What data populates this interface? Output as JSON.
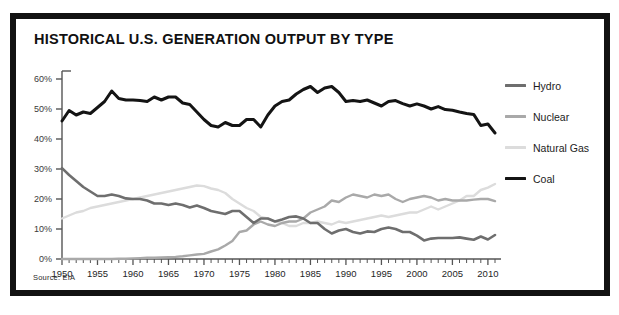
{
  "figure": {
    "title": "HISTORICAL U.S. GENERATION OUTPUT BY TYPE",
    "source": "Source: EIA"
  },
  "legend": {
    "position": "right",
    "items": [
      {
        "label": "Hydro",
        "color": "#6e6e6e"
      },
      {
        "label": "Nuclear",
        "color": "#a9a9a9"
      },
      {
        "label": "Natural Gas",
        "color": "#dcdcdc"
      },
      {
        "label": "Coal",
        "color": "#141414"
      }
    ]
  },
  "axes": {
    "y_ticks": [
      "0%",
      "10%",
      "20%",
      "30%",
      "40%",
      "50%",
      "60%"
    ],
    "x_ticks": [
      "1950",
      "1955",
      "1960",
      "1965",
      "1970",
      "1975",
      "1980",
      "1985",
      "1990",
      "1995",
      "2000",
      "2005",
      "2010"
    ]
  },
  "chart_data": {
    "type": "line",
    "title": "HISTORICAL U.S. GENERATION OUTPUT BY TYPE",
    "subtitle": "",
    "xlabel": "",
    "ylabel": "",
    "xlim": [
      1950,
      2011
    ],
    "ylim": [
      0,
      60
    ],
    "y_unit": "percent",
    "grid": false,
    "legend_position": "right",
    "annotations": [
      "Source: EIA"
    ],
    "x": [
      1950,
      1951,
      1952,
      1953,
      1954,
      1955,
      1956,
      1957,
      1958,
      1959,
      1960,
      1961,
      1962,
      1963,
      1964,
      1965,
      1966,
      1967,
      1968,
      1969,
      1970,
      1971,
      1972,
      1973,
      1974,
      1975,
      1976,
      1977,
      1978,
      1979,
      1980,
      1981,
      1982,
      1983,
      1984,
      1985,
      1986,
      1987,
      1988,
      1989,
      1990,
      1991,
      1992,
      1993,
      1994,
      1995,
      1996,
      1997,
      1998,
      1999,
      2000,
      2001,
      2002,
      2003,
      2004,
      2005,
      2006,
      2007,
      2008,
      2009,
      2010,
      2011
    ],
    "series": [
      {
        "name": "Coal",
        "color": "#141414",
        "values": [
          46.0,
          49.5,
          48.0,
          49.0,
          48.5,
          50.5,
          52.5,
          56.0,
          53.5,
          53.0,
          53.0,
          52.8,
          52.5,
          54.0,
          53.0,
          54.0,
          54.0,
          52.0,
          51.5,
          49.0,
          46.5,
          44.5,
          44.0,
          45.5,
          44.5,
          44.5,
          46.5,
          46.5,
          44.0,
          48.0,
          51.0,
          52.5,
          53.0,
          55.0,
          56.5,
          57.5,
          55.5,
          57.0,
          57.5,
          55.5,
          52.5,
          52.8,
          52.5,
          53.0,
          52.0,
          51.0,
          52.5,
          52.8,
          51.8,
          51.0,
          51.7,
          51.0,
          50.0,
          50.8,
          49.8,
          49.6,
          49.0,
          48.5,
          48.2,
          44.5,
          45.0,
          42.0
        ]
      },
      {
        "name": "Hydro",
        "color": "#6e6e6e",
        "values": [
          30.3,
          28.0,
          26.0,
          24.0,
          22.5,
          21.0,
          21.0,
          21.5,
          21.0,
          20.2,
          20.0,
          20.0,
          19.5,
          18.5,
          18.5,
          18.0,
          18.5,
          18.0,
          17.2,
          17.8,
          17.0,
          16.0,
          15.5,
          15.0,
          16.0,
          16.0,
          14.0,
          12.0,
          13.5,
          13.5,
          12.5,
          13.2,
          14.0,
          14.2,
          13.5,
          12.0,
          12.0,
          10.0,
          8.5,
          9.5,
          10.0,
          9.0,
          8.5,
          9.2,
          9.0,
          10.0,
          10.5,
          10.0,
          9.0,
          9.0,
          7.8,
          6.2,
          6.8,
          7.0,
          7.0,
          7.0,
          7.2,
          6.8,
          6.4,
          7.5,
          6.5,
          8.0
        ]
      },
      {
        "name": "Nuclear",
        "color": "#a9a9a9",
        "values": [
          0.0,
          0.0,
          0.0,
          0.0,
          0.0,
          0.0,
          0.0,
          0.0,
          0.1,
          0.1,
          0.2,
          0.3,
          0.4,
          0.4,
          0.5,
          0.6,
          0.7,
          0.9,
          1.2,
          1.5,
          1.7,
          2.5,
          3.2,
          4.5,
          6.0,
          9.0,
          9.5,
          11.5,
          12.5,
          11.5,
          11.0,
          12.0,
          12.5,
          12.5,
          13.5,
          15.5,
          16.5,
          17.5,
          19.5,
          19.0,
          20.5,
          21.5,
          21.0,
          20.5,
          21.5,
          21.0,
          21.5,
          20.0,
          19.0,
          20.0,
          20.5,
          21.0,
          20.5,
          19.5,
          20.0,
          19.5,
          19.5,
          19.5,
          19.8,
          20.0,
          20.0,
          19.3
        ]
      },
      {
        "name": "Natural Gas",
        "color": "#dcdcdc",
        "values": [
          13.5,
          14.5,
          15.5,
          16.0,
          17.0,
          17.5,
          18.0,
          18.5,
          19.0,
          19.5,
          20.0,
          20.5,
          21.0,
          21.5,
          22.0,
          22.5,
          23.0,
          23.5,
          24.0,
          24.5,
          24.3,
          23.5,
          23.0,
          22.0,
          20.0,
          18.5,
          17.0,
          16.0,
          14.0,
          13.5,
          12.5,
          12.0,
          11.0,
          11.0,
          12.0,
          12.0,
          12.5,
          12.0,
          11.5,
          12.5,
          12.0,
          12.5,
          13.0,
          13.5,
          14.0,
          14.5,
          14.0,
          14.5,
          15.0,
          15.5,
          15.5,
          16.5,
          17.5,
          16.5,
          17.5,
          18.5,
          19.5,
          21.0,
          21.0,
          23.0,
          23.8,
          25.0
        ]
      }
    ]
  }
}
